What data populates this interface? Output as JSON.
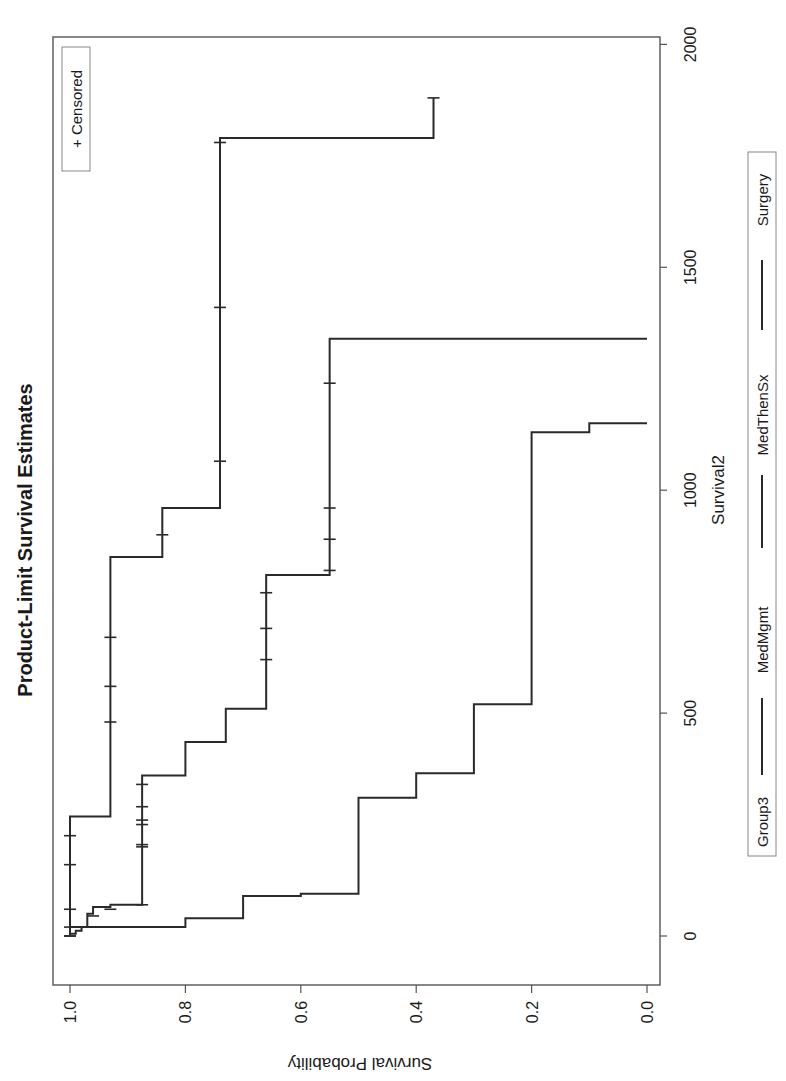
{
  "chart_data": {
    "type": "line",
    "subtype": "kaplan-meier step",
    "orientation_note": "image rotated 90 degrees clockwise",
    "title": "Product-Limit Survival Estimates",
    "xlabel": "Survival2",
    "ylabel": "Survival Probability",
    "xlim": [
      -100,
      2050
    ],
    "ylim": [
      0.0,
      1.0
    ],
    "x_ticks": [
      "0",
      "500",
      "1000",
      "1500",
      "2000"
    ],
    "y_ticks": [
      "0.0",
      "0.2",
      "0.4",
      "0.6",
      "0.8",
      "1.0"
    ],
    "grid": false,
    "legend": {
      "title": "Group3",
      "entries": [
        "MedMgmt",
        "MedThenSx",
        "Surgery"
      ],
      "position": "bottom"
    },
    "inset_legend": "+ Censored",
    "series": [
      {
        "name": "MedMgmt",
        "steps": [
          [
            0,
            1.0
          ],
          [
            5,
            0.99
          ],
          [
            12,
            0.98
          ],
          [
            20,
            0.8
          ],
          [
            40,
            0.7
          ],
          [
            90,
            0.6
          ],
          [
            95,
            0.5
          ],
          [
            310,
            0.4
          ],
          [
            365,
            0.3
          ],
          [
            520,
            0.2
          ],
          [
            1130,
            0.1
          ],
          [
            1150,
            0.0
          ]
        ],
        "censored": [
          [
            0,
            1.0
          ]
        ]
      },
      {
        "name": "MedThenSx",
        "steps": [
          [
            0,
            1.0
          ],
          [
            20,
            0.97
          ],
          [
            50,
            0.96
          ],
          [
            65,
            0.93
          ],
          [
            70,
            0.875
          ],
          [
            360,
            0.8
          ],
          [
            435,
            0.73
          ],
          [
            510,
            0.66
          ],
          [
            810,
            0.55
          ],
          [
            1340,
            0.0
          ]
        ],
        "censored": [
          [
            0,
            1.0
          ],
          [
            45,
            0.96
          ],
          [
            60,
            0.93
          ],
          [
            70,
            0.875
          ],
          [
            200,
            0.875
          ],
          [
            205,
            0.875
          ],
          [
            250,
            0.875
          ],
          [
            260,
            0.875
          ],
          [
            290,
            0.875
          ],
          [
            340,
            0.875
          ],
          [
            620,
            0.66
          ],
          [
            690,
            0.66
          ],
          [
            770,
            0.66
          ],
          [
            820,
            0.55
          ],
          [
            890,
            0.55
          ],
          [
            960,
            0.55
          ],
          [
            1240,
            0.55
          ]
        ]
      },
      {
        "name": "Surgery",
        "steps": [
          [
            0,
            1.0
          ],
          [
            268,
            0.93
          ],
          [
            850,
            0.84
          ],
          [
            960,
            0.74
          ],
          [
            1790,
            0.37
          ]
        ],
        "censored": [
          [
            20,
            1.0
          ],
          [
            60,
            1.0
          ],
          [
            160,
            1.0
          ],
          [
            225,
            1.0
          ],
          [
            480,
            0.93
          ],
          [
            560,
            0.93
          ],
          [
            670,
            0.93
          ],
          [
            900,
            0.84
          ],
          [
            1065,
            0.74
          ],
          [
            1410,
            0.74
          ],
          [
            1780,
            0.74
          ],
          [
            1880,
            0.37
          ]
        ]
      }
    ]
  }
}
